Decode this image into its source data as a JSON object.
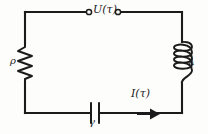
{
  "figure": {
    "background_color": "#fdfdfc",
    "line_color": "#1b1b1b",
    "width": 208,
    "height": 134
  },
  "labels": {
    "voltage": "U(τ)",
    "current": "I(τ)",
    "resistor": "ρ",
    "inductor": "λ",
    "capacitor": "γ"
  },
  "components": [
    {
      "name": "resistor",
      "symbol": "zigzag",
      "label": "ρ",
      "position": "left-branch",
      "label_side": "left"
    },
    {
      "name": "inductor",
      "symbol": "coil",
      "label": "λ",
      "position": "right-branch",
      "label_side": "right",
      "turns": 4
    },
    {
      "name": "capacitor",
      "symbol": "parallel-plates",
      "label": "γ",
      "position": "bottom-branch",
      "label_side": "below"
    },
    {
      "name": "voltage-source-terminals",
      "symbol": "open-circle-pair",
      "label": "U(τ)",
      "position": "top-branch",
      "label_side": "between"
    },
    {
      "name": "current-arrow",
      "symbol": "arrow-right",
      "label": "I(τ)",
      "position": "bottom-branch-right",
      "direction": "right"
    }
  ]
}
